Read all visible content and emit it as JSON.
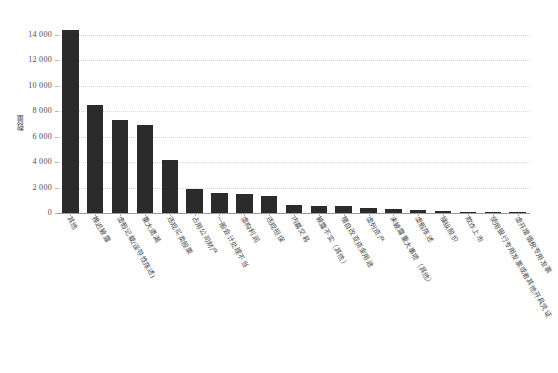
{
  "chart_data": {
    "type": "bar",
    "title": "",
    "xlabel": "",
    "ylabel": "数量",
    "ylim": [
      0,
      15000
    ],
    "yticks": [
      0,
      2000,
      4000,
      6000,
      8000,
      10000,
      12000,
      14000
    ],
    "ytick_labels": [
      "0",
      "2 000",
      "4 000",
      "6 000",
      "8 000",
      "10 000",
      "12 000",
      "14 000"
    ],
    "grid": true,
    "legend": "none",
    "bar_color": "#2b2b2b",
    "categories": [
      "其他",
      "推迟披露",
      "虚假记载(误导性陈述)",
      "重大遗漏",
      "违规买卖股票",
      "占用公司财产",
      "一般会计处理不当",
      "虚构利润",
      "违规担保",
      "内幕交易",
      "披露不实（其他）",
      "擅自改变资金用途",
      "虚列资产",
      "未披露重大事项（其他）",
      "虚假陈述",
      "操纵股价",
      "欺诈上市",
      "使用银行专用发票或者其他开具凭证",
      "虚开增值税专用发票"
    ],
    "values": [
      14400,
      8500,
      7300,
      6900,
      4200,
      1900,
      1600,
      1500,
      1350,
      620,
      560,
      520,
      420,
      330,
      200,
      140,
      110,
      80,
      50
    ]
  },
  "axes": {
    "y_axis_title": "数量"
  }
}
